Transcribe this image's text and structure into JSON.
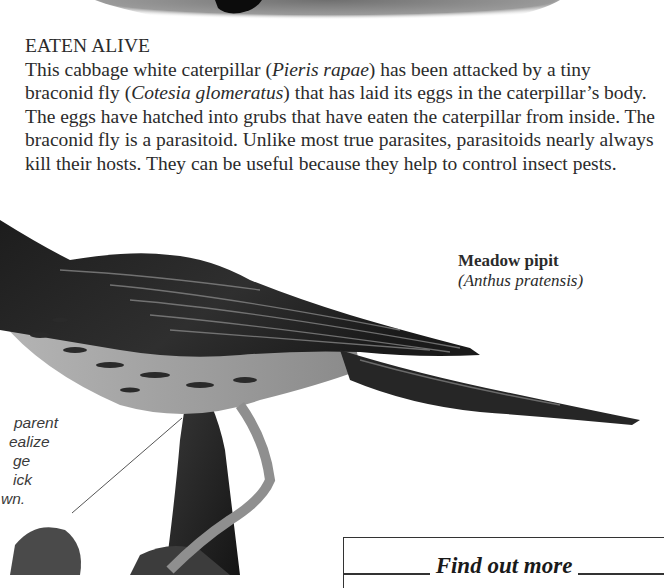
{
  "caption": {
    "title": "EATEN ALIVE",
    "segments": [
      {
        "text": "This cabbage white caterpillar (",
        "italic": false
      },
      {
        "text": "Pieris rapae",
        "italic": true
      },
      {
        "text": ") has been attacked by a tiny braconid fly (",
        "italic": false
      },
      {
        "text": "Cotesia glomeratus",
        "italic": true
      },
      {
        "text": ") that has laid its eggs in the caterpillar’s body. The eggs have hatched into grubs that have eaten the caterpillar from inside. The braconid fly is a parasitoid. Unlike most true parasites, parasitoids nearly always kill their hosts. They can be useful because they help to control insect pests.",
        "italic": false
      }
    ]
  },
  "species_label": {
    "common_name": "Meadow pipit",
    "latin_name": "(Anthus pratensis)"
  },
  "side_note": {
    "lines": [
      "parent",
      "ealize",
      "ge",
      "ick",
      "wn."
    ]
  },
  "find_out_more": {
    "label": "Find out more"
  },
  "images": {
    "top_photo": "caterpillar-photo-cropped",
    "main_photo": "meadow-pipit-bird-photo"
  }
}
